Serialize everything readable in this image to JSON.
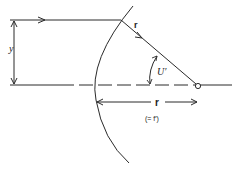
{
  "figure": {
    "type": "optics-diagram",
    "colors": {
      "stroke": "#2a2a2a",
      "background": "#ffffff"
    }
  },
  "labels": {
    "height": "y",
    "ray": "r",
    "angle": "U′",
    "radius": "r",
    "radius_note": "(= f′)"
  }
}
